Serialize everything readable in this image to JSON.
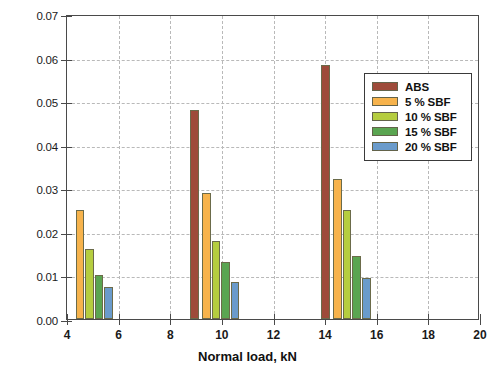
{
  "chart_data": {
    "type": "bar",
    "title": "",
    "xlabel": "Normal load, kN",
    "ylabel": "Weight Loss, mg",
    "xlim": [
      4,
      20
    ],
    "ylim": [
      0,
      0.07
    ],
    "xticks": [
      "4",
      "6",
      "8",
      "10",
      "12",
      "14",
      "16",
      "18",
      "20"
    ],
    "yticks": [
      "0.00",
      "0.01",
      "0.02",
      "0.03",
      "0.04",
      "0.05",
      "0.06",
      "0.07"
    ],
    "grid": true,
    "legend_position": "upper right",
    "categories": [
      4.9,
      9.8,
      14.9
    ],
    "series": [
      {
        "name": "ABS",
        "color": "#9e4b3a",
        "values": [
          null,
          0.048,
          0.0583
        ]
      },
      {
        "name": "5 % SBF",
        "color": "#f7b34c",
        "values": [
          0.025,
          0.029,
          0.0322
        ]
      },
      {
        "name": "10 % SBF",
        "color": "#b5cd3f",
        "values": [
          0.016,
          0.018,
          0.025
        ]
      },
      {
        "name": "15 % SBF",
        "color": "#5aa551",
        "values": [
          0.01,
          0.013,
          0.0145
        ]
      },
      {
        "name": "20 % SBF",
        "color": "#6a9bcb",
        "values": [
          0.0073,
          0.0085,
          0.0095
        ]
      }
    ],
    "bar_x_positions": [
      [
        null,
        4.33,
        4.7,
        5.07,
        5.44
      ],
      [
        8.77,
        9.23,
        9.6,
        9.97,
        10.34
      ],
      [
        13.85,
        14.31,
        14.68,
        15.05,
        15.42
      ]
    ],
    "bar_width_kn": 0.34
  },
  "legend": {
    "entries": [
      {
        "label": "ABS",
        "color": "#9e4b3a"
      },
      {
        "label": "5 % SBF",
        "color": "#f7b34c"
      },
      {
        "label": "10 % SBF",
        "color": "#b5cd3f"
      },
      {
        "label": "15 % SBF",
        "color": "#5aa551"
      },
      {
        "label": "20 % SBF",
        "color": "#6a9bcb"
      }
    ]
  }
}
